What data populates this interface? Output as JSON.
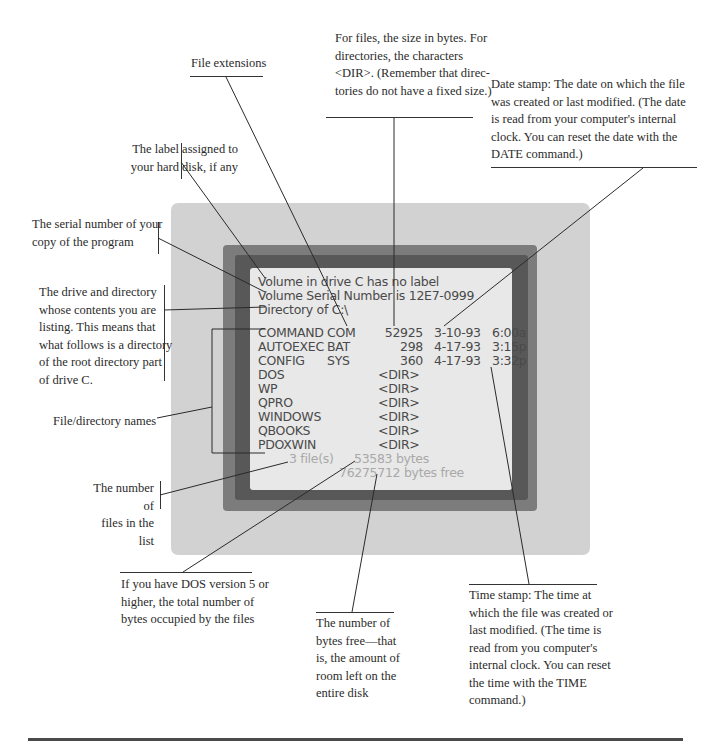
{
  "screen": {
    "header_lines": [
      "Volume in drive C has no label",
      "Volume Serial Number is 12E7-0999",
      "Directory of C:\\"
    ],
    "files": [
      {
        "name": "COMMAND",
        "ext": "COM",
        "size": "52925",
        "date": "3-10-93",
        "time": "6:00a"
      },
      {
        "name": "AUTOEXEC",
        "ext": "BAT",
        "size": "298",
        "date": "4-17-93",
        "time": "3:15p"
      },
      {
        "name": "CONFIG",
        "ext": "SYS",
        "size": "360",
        "date": "4-17-93",
        "time": "3:32p"
      }
    ],
    "directories": [
      {
        "name": "DOS",
        "size": "<DIR>"
      },
      {
        "name": "WP",
        "size": "<DIR>"
      },
      {
        "name": "QPRO",
        "size": "<DIR>"
      },
      {
        "name": "WINDOWS",
        "size": "<DIR>"
      },
      {
        "name": "QBOOKS",
        "size": "<DIR>"
      },
      {
        "name": "PDOXWIN",
        "size": "<DIR>"
      }
    ],
    "summary": {
      "file_count": "3 file(s)",
      "bytes_used": "53583 bytes",
      "bytes_free": "76275712 bytes free"
    }
  },
  "annotations": {
    "file_extensions": "File extensions",
    "size_in_bytes": [
      "For files, the size in bytes. For",
      "directories, the characters",
      "<DIR>. (Remember that direc-",
      "tories do not have a fixed size.)"
    ],
    "date_stamp": [
      "Date stamp: The date on which the file",
      "was created or last modified. (The date",
      "is read from your computer's internal",
      "clock. You can reset the date with the",
      "DATE command.)"
    ],
    "disk_label": [
      "The label assigned to",
      "your hard disk, if any"
    ],
    "serial_number": [
      "The serial number of your",
      "copy of the program"
    ],
    "drive_directory": [
      "The drive and directory",
      "whose contents you are",
      "listing. This means that",
      "what follows is a directory",
      "of the root directory part",
      "of drive C."
    ],
    "file_dir_names": "File/directory names",
    "number_of_files": [
      "The number of",
      "files in the list"
    ],
    "total_bytes": [
      "If you have DOS version 5 or",
      "higher, the total number of",
      "bytes occupied by the files"
    ],
    "bytes_free": [
      "The number of",
      "bytes free—that",
      "is, the amount of",
      "room left on the",
      "entire disk"
    ],
    "time_stamp": [
      "Time stamp: The time at",
      "which the file was created or",
      "last modified. (The time is",
      "read from you computer's",
      "internal clock. You can reset",
      "the time with the TIME",
      "command.)"
    ]
  },
  "colors": {
    "panel_outer": "#d2d2d2",
    "frame_mid": "#7c7c7c",
    "frame_dark": "#585858",
    "screen_bg": "#e8e8e8",
    "screen_text": "#4a4a4a",
    "screen_text_faded": "#a9a9a9"
  }
}
